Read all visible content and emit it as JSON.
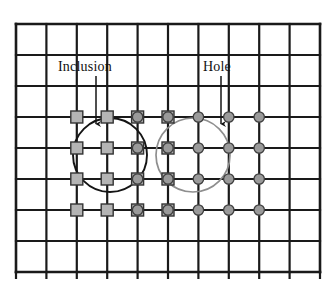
{
  "figure": {
    "type": "mesh-diagram",
    "background_color": "#ffffff",
    "width": 336,
    "height": 295
  },
  "labels": [
    {
      "id": "inclusion",
      "text": "Inclusion",
      "x": 58,
      "y": 59
    },
    {
      "id": "hole",
      "text": "Hole",
      "x": 203,
      "y": 59
    }
  ],
  "label_text": {
    "inclusion": "Inclusion",
    "hole": "Hole"
  },
  "chart_data": {
    "type": "diagram",
    "title": "",
    "grid": {
      "x_min": 16,
      "x_max": 320,
      "y_min": 24,
      "y_max": 272,
      "columns": 10,
      "rows": 8,
      "cell_width": 30.4,
      "cell_height": 31.0,
      "line_color": "#1a1a1a",
      "line_width": 2.2,
      "border_width": 2.6,
      "x_lines": [
        16,
        46.4,
        76.8,
        107.2,
        137.6,
        168,
        198.4,
        228.8,
        259.2,
        289.6,
        320
      ],
      "y_lines": [
        24,
        55,
        86,
        117,
        148,
        179,
        210,
        241,
        272
      ],
      "tick_length": 7,
      "ticks_bottom": true
    },
    "circles": [
      {
        "id": "inclusion-circle",
        "label": "Inclusion",
        "cx": 110,
        "cy": 155,
        "r": 37,
        "stroke": "#141414",
        "stroke_width": 1.9,
        "fill": "none"
      },
      {
        "id": "hole-circle",
        "label": "Hole",
        "cx": 193,
        "cy": 155,
        "r": 37,
        "stroke": "#8e8e8e",
        "stroke_width": 1.7,
        "fill": "none"
      }
    ],
    "arrows": [
      {
        "id": "inclusion-arrow",
        "from_label": "Inclusion",
        "x1": 96,
        "y1": 76,
        "x2": 96,
        "y2": 124,
        "color": "#141414"
      },
      {
        "id": "hole-arrow",
        "from_label": "Hole",
        "x1": 221,
        "y1": 76,
        "x2": 221,
        "y2": 124,
        "color": "#141414"
      }
    ],
    "markers": {
      "square": {
        "shape": "square",
        "size": 12,
        "fill": "#b4b4b4",
        "stroke": "#333333",
        "stroke_width": 1.4,
        "meaning": "inclusion enriched node"
      },
      "circle": {
        "shape": "circle",
        "radius": 5.2,
        "fill": "#9a9a9a",
        "stroke": "#3d3d3d",
        "stroke_width": 1.3,
        "meaning": "hole enriched node"
      },
      "square_columns_x": [
        76.8,
        107.2,
        137.6,
        168
      ],
      "circle_columns_x": [
        137.6,
        168,
        198.4,
        228.8,
        259.2
      ],
      "rows_y": [
        117,
        148,
        179,
        210
      ],
      "overlap_columns_x": [
        137.6,
        168
      ]
    },
    "legend": [],
    "xlabel": "",
    "ylabel": ""
  }
}
